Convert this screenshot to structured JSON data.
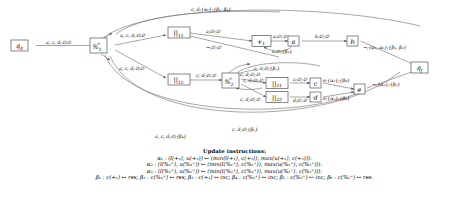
{
  "figure": {
    "kind": "symbolic-register-automaton",
    "instructions_title": "Update instructions:"
  },
  "nodes": [
    {
      "id": "q0",
      "label": "q",
      "sub": "0",
      "x": 19,
      "y": 40,
      "w": 17,
      "h": 11
    },
    {
      "id": "p1",
      "label": "%",
      "sub": "1",
      "sup": "+",
      "x": 98,
      "y": 38,
      "w": 17,
      "h": 15
    },
    {
      "id": "par11",
      "label": "||",
      "sub": "11",
      "x": 168,
      "y": 28,
      "w": 22,
      "h": 11
    },
    {
      "id": "plus1",
      "label": "+",
      "sub": "1",
      "x": 254,
      "y": 36,
      "w": 17,
      "h": 11
    },
    {
      "id": "na",
      "label": "a",
      "x": 290,
      "y": 36,
      "w": 12,
      "h": 10
    },
    {
      "id": "nb",
      "label": "b",
      "x": 349,
      "y": 36,
      "w": 12,
      "h": 10
    },
    {
      "id": "par12",
      "label": "||",
      "sub": "12",
      "x": 168,
      "y": 74,
      "w": 22,
      "h": 11
    },
    {
      "id": "p2",
      "label": "%",
      "sub": "2",
      "sup": "+",
      "x": 224,
      "y": 72,
      "w": 17,
      "h": 15
    },
    {
      "id": "par21",
      "label": "||",
      "sub": "21",
      "x": 268,
      "y": 78,
      "w": 22,
      "h": 11
    },
    {
      "id": "par22",
      "label": "||",
      "sub": "22",
      "x": 268,
      "y": 92,
      "w": 22,
      "h": 11
    },
    {
      "id": "nc",
      "label": "c",
      "x": 312,
      "y": 78,
      "w": 11,
      "h": 10
    },
    {
      "id": "nd",
      "label": "d",
      "x": 312,
      "y": 92,
      "w": 11,
      "h": 10
    },
    {
      "id": "ne",
      "label": "e",
      "x": 356,
      "y": 86,
      "w": 11,
      "h": 10
    },
    {
      "id": "qf",
      "label": "q",
      "sub": "f",
      "x": 419,
      "y": 63,
      "w": 17,
      "h": 11
    }
  ],
  "edge_labels": {
    "q0_p1": {
      "text": "a, c, d;∅;∅"
    },
    "p1_par11": {
      "text": "a, c, d;∅;∅"
    },
    "p1_par12": {
      "text": "a, c, d;∅;∅"
    },
    "par11_plus1": {
      "text": "a;∅;∅"
    },
    "par11_alt": {
      "text": "¬;∅;∅"
    },
    "plus1_a": {
      "text": "a;∅;∅"
    },
    "a_plus1": {
      "text": "a;∅;{β₃}"
    },
    "a_b": {
      "text": "b;∅;∅"
    },
    "b_qf": {
      "text": "¬;{α₁, α₂};{β₁, β₂}"
    },
    "top_back": {
      "text": "c, d;{α₁};{β₁, β₄}"
    },
    "par12_p2": {
      "text": "c, d;∅;∅"
    },
    "p2_par21": {
      "text": "c, d;∅;∅"
    },
    "p2_par22": {
      "text": "c, d;∅;∅"
    },
    "p2_top": {
      "text": "c, d;∅;{β₅}"
    },
    "p2_in_upper": {
      "text": "c, d;∅;∅"
    },
    "par21_c": {
      "text": "c;∅;∅"
    },
    "par22_d": {
      "text": "d;∅;∅"
    },
    "c_e": {
      "text": "e;{α₃};{β₆}"
    },
    "d_e": {
      "text": "e;{α₃};{β₆}"
    },
    "e_qf": {
      "text": "¬;{α₂};{β₂}"
    },
    "low_back1": {
      "text": "c, d;∅;{β₅}"
    },
    "low_back2": {
      "text": "a, c, d;∅;{β₄}"
    }
  },
  "instructions": {
    "alpha1": "α₁ : (l(+₁), u(+₁)) ↦ (min(l(+₁), c(+₁)), max(u(+₁), c(+₁))).",
    "alpha2": "α₂ : (l(%₁⁺), u(%₁⁺)) ↦ (min(l(%₁⁺), c(%₁⁺)), max(u(%₁⁺), c(%₁⁺))).",
    "alpha3": "α₃ : (l(%₂⁺), u(%₂⁺)) ↦ (min(l(%₂⁺), c(%₂⁺)), max(u(%₂⁺), c(%₂⁺))).",
    "betas": "β₁ : c(+₁) ↦ res; β₂ : c(%₁⁺) ↦ res; β₃ : c(+₁) ↦ inc; β₄ : c(%₁⁺) ↦ inc; β₅ : c(%₂⁺) ↦ inc; β₆ : c(%₂⁺) ↦ res."
  }
}
